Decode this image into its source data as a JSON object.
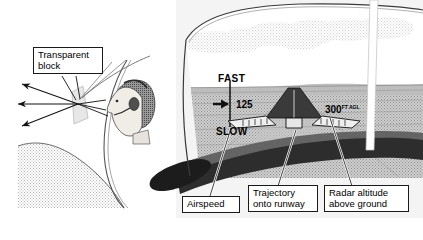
{
  "figure": {
    "panels": [
      {
        "id": "left",
        "name": "transparent-block-optics",
        "description": "Pilot head in profile viewing through a transparent HUD combiner block with collimated light rays"
      },
      {
        "id": "right",
        "name": "hud-through-windshield",
        "description": "Cockpit forward view with HUD symbology overlaid on runway approach scene"
      }
    ]
  },
  "left_panel": {
    "callout": {
      "label": "Transparent\nblock",
      "name": "transparent-block"
    },
    "rays": {
      "count": 3,
      "direction": "left",
      "name": "light-rays"
    },
    "pilot": {
      "name": "pilot-head",
      "facing": "left",
      "wearing": "headset"
    }
  },
  "right_panel": {
    "hud": {
      "fast_label": "FAST",
      "slow_label": "SLOW",
      "airspeed_value": "125",
      "airspeed_arrow": "➡",
      "altitude_value": "300",
      "altitude_units": "FT AGL"
    },
    "callouts": [
      {
        "name": "airspeed",
        "label": "Airspeed"
      },
      {
        "name": "trajectory-onto-runway",
        "label": "Trajectory\nonto runway"
      },
      {
        "name": "radar-altitude-above-ground",
        "label": "Radar altitude\nabove ground"
      }
    ],
    "scene": {
      "sky": "clouds",
      "horizon": "distant terrain",
      "foreground": "glareshield"
    }
  },
  "colors": {
    "ink": "#1a1a1a",
    "paper": "#ffffff",
    "sky_tint": "#e9e9e9",
    "ground_tint": "#d8d8d8",
    "glareshield_dark": "#2b2b2b",
    "glareshield_mid": "#5e5e5e",
    "panel_bg": "#f2f2f2"
  }
}
